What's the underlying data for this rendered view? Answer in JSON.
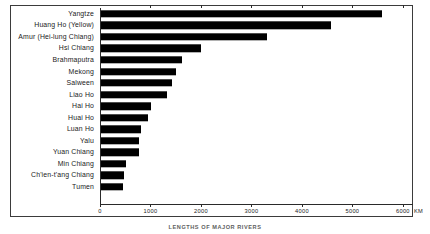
{
  "caption": "LENGTHS OF MAJOR RIVERS",
  "unit_label": "KM",
  "chart_data": {
    "type": "bar",
    "orientation": "horizontal",
    "title": "LENGTHS OF MAJOR RIVERS",
    "xlabel": "KM",
    "ylabel": "",
    "xlim": [
      0,
      6200
    ],
    "grid": false,
    "legend": "none",
    "tick_labels": [
      "0",
      "1000",
      "2000",
      "3000",
      "4000",
      "5000",
      "6000"
    ],
    "ticks": [
      0,
      1000,
      2000,
      3000,
      4000,
      5000,
      6000
    ],
    "categories": [
      "Yangtze",
      "Huang Ho (Yellow)",
      "Amur (Hei-lung Chiang)",
      "Hsi Chiang",
      "Brahmaputra",
      "Mekong",
      "Salween",
      "Liao Ho",
      "Hai Ho",
      "Huai Ho",
      "Luan Ho",
      "Yalu",
      "Yuan Chiang",
      "Min Chiang",
      "Ch'ien-t'ang Chiang",
      "Tumen"
    ],
    "values": [
      5580,
      4580,
      3310,
      2010,
      1620,
      1500,
      1430,
      1330,
      1010,
      950,
      810,
      780,
      770,
      510,
      470,
      450
    ]
  }
}
